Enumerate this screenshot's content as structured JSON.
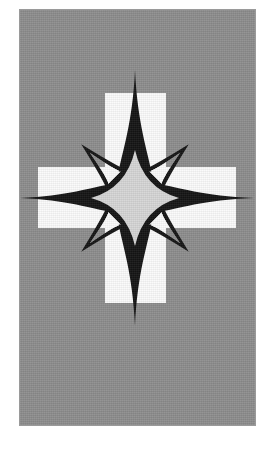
{
  "image": {
    "title": "Compass star over Greek cross emblem",
    "width": 269,
    "height": 449,
    "background_color": "#ffffff"
  },
  "panel": {
    "name": "gray-plate",
    "x": 20,
    "y": 10,
    "width": 235,
    "height": 415,
    "fill_color": "#8c8c8c",
    "texture": "fine-grain-noise",
    "border_color": "#9a9a9a"
  },
  "cross": {
    "name": "greek-cross",
    "fill_color": "#fbfbfb",
    "center_x": 135,
    "center_y": 198,
    "arm_thickness": 61,
    "vertical_top": 93,
    "vertical_bottom": 303,
    "horizontal_left": 38,
    "horizontal_right": 236,
    "vertical_left": 105,
    "vertical_right": 166,
    "horizontal_top": 167,
    "horizontal_bottom": 228
  },
  "star": {
    "name": "eight-pointed-compass-star",
    "center_x": 135,
    "center_y": 198,
    "outline_color": "#141414",
    "core_fill_color": "#d6d6d6",
    "ray_interior_color": "#8c8c8c",
    "points": 8,
    "cardinal_rays": {
      "count": 4,
      "up_tip_y": 70,
      "down_tip_y": 326,
      "left_tip_x": 20,
      "right_tip_x": 254,
      "description": "long needle rays reaching the plate edges"
    },
    "diagonal_rays": {
      "count": 4,
      "length": 76,
      "description": "short hollow barbed rays at 45 degrees"
    },
    "core": {
      "radius_x": 44,
      "radius_y": 48,
      "shape": "concave four-lobed astroid"
    }
  },
  "palette": {
    "white": "#ffffff",
    "plate_gray": "#8c8c8c",
    "cross_white": "#fbfbfb",
    "star_core_gray": "#d6d6d6",
    "ink_black": "#141414"
  }
}
